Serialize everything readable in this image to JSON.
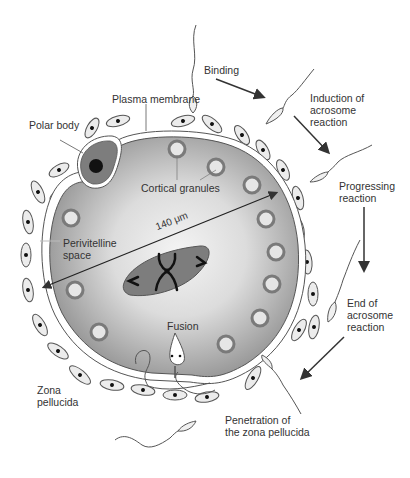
{
  "diagram": {
    "colors": {
      "cytoplasm_edge": "#8a8a8a",
      "cytoplasm_center": "#f2f2f2",
      "membrane": "#ffffff",
      "outline": "#555555",
      "granule_ring": "#7a7a7a",
      "granule_fill": "#e6e6e6",
      "spindle_fill": "#7d7d7d",
      "polar_body_fill": "#7d7d7d",
      "nucleus": "#111111",
      "cell_fill": "#e8e8e8",
      "arrow": "#333333",
      "text": "#333333"
    },
    "labels": {
      "binding": "Binding",
      "plasma_membrane": "Plasma membrane",
      "polar_body": "Polar body",
      "induction": "Induction of\nacrosome\nreaction",
      "cortical_granules": "Cortical granules",
      "progressing": "Progressing\nreaction",
      "diameter": "140 μm",
      "perivitelline": "Perivitelline\nspace",
      "end_of_acrosome": "End of\nacrosome\nreaction",
      "fusion": "Fusion",
      "zona_pellucida": "Zona\npellucida",
      "penetration": "Penetration of\nthe zona pellucida"
    },
    "sequence_steps": [
      "Binding",
      "Induction of acrosome reaction",
      "Progressing reaction",
      "End of acrosome reaction",
      "Penetration of the zona pellucida",
      "Fusion"
    ],
    "measurement": {
      "value": 140,
      "unit": "μm"
    }
  }
}
